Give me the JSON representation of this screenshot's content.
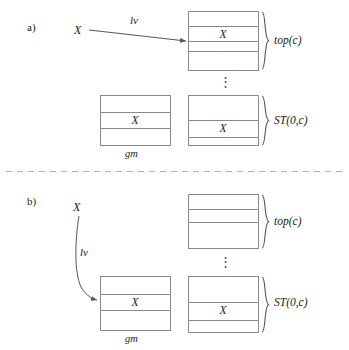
{
  "figure": {
    "title_visible": false,
    "background_color": "#ffffff",
    "line_color": "#808080",
    "arrow_color": "#555555",
    "text_color": "#1a1a1a",
    "divider_color": "#b0a0a0"
  },
  "panels": [
    {
      "id": "a",
      "label": "a)",
      "source_var": "X",
      "edge_label": "lv",
      "arrow_style": "straight",
      "boxes": [
        {
          "name": "top-c-box",
          "rows": 4,
          "cell_text": "X",
          "cell_row_index": 1,
          "group_label": "top(c)"
        },
        {
          "name": "gm-box",
          "rows": 3,
          "cell_text": "X",
          "cell_row_index": 1,
          "struct_label": "gm"
        },
        {
          "name": "st-box",
          "rows": 3,
          "cell_text": "X",
          "cell_row_index": 1,
          "group_label": "ST(0,c)"
        }
      ],
      "ellipsis": "⋮"
    },
    {
      "id": "b",
      "label": "b)",
      "source_var": "X",
      "edge_label": "lv",
      "arrow_style": "curved",
      "boxes": [
        {
          "name": "top-c-box",
          "rows": 3,
          "cell_text": "",
          "cell_row_index": null,
          "group_label": "top(c)"
        },
        {
          "name": "gm-box",
          "rows": 4,
          "cell_text": "X",
          "cell_row_index": 1,
          "struct_label": "gm"
        },
        {
          "name": "st-box",
          "rows": 3,
          "cell_text": "X",
          "cell_row_index": 1,
          "group_label": "ST(0,c)"
        }
      ],
      "ellipsis": "⋮"
    }
  ],
  "labels": {
    "panel_a": "a)",
    "panel_b": "b)",
    "top_c": "top(c)",
    "st_0_c": "ST(0,c)",
    "gm": "gm",
    "lv": "lv",
    "x": "X",
    "vdots": "⋮"
  }
}
